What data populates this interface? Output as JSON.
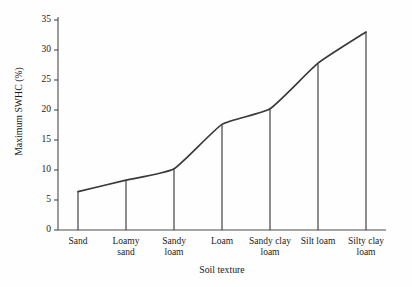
{
  "chart_data": {
    "type": "line",
    "title": "",
    "xlabel": "Soil texture",
    "ylabel": "Maximum SWHC (%)",
    "categories": [
      "Sand",
      "Loamy sand",
      "Sandy loam",
      "Loam",
      "Sandy clay loam",
      "Silt loam",
      "Silty clay loam"
    ],
    "values": [
      6.4,
      8.3,
      10.2,
      17.6,
      20.2,
      27.8,
      33.0
    ],
    "series": [
      {
        "name": "Maximum SWHC",
        "values": [
          6.4,
          8.3,
          10.2,
          17.6,
          20.2,
          27.8,
          33.0
        ]
      }
    ],
    "ylim": [
      0,
      35
    ],
    "yticks": [
      0,
      5,
      10,
      15,
      20,
      25,
      30,
      35
    ],
    "ytick_labels": [
      "0",
      "5",
      "10",
      "15",
      "20",
      "25",
      "30",
      "35"
    ],
    "xtick_labels": [
      [
        "Sand"
      ],
      [
        "Loamy",
        "sand"
      ],
      [
        "Sandy",
        "loam"
      ],
      [
        "Loam"
      ],
      [
        "Sandy clay",
        "loam"
      ],
      [
        "Silt loam"
      ],
      [
        "Silty clay",
        "loam"
      ]
    ],
    "grid": false,
    "legend": "none",
    "line_color": "#3a3a3a",
    "axis_color": "#4a4a4a",
    "background_color": "#fffefe",
    "smoothing": "spline",
    "drop_lines": true
  }
}
